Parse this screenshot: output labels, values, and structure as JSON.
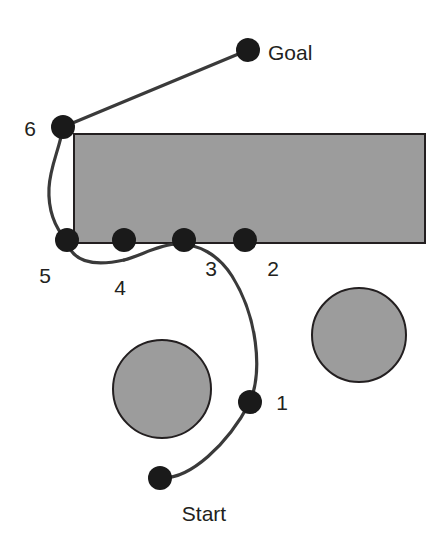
{
  "figure": {
    "type": "path-planning-diagram",
    "background_color": "#ffffff",
    "stroke_color": "#231f20",
    "obstacle_fill": "#9c9c9c",
    "obstacle_stroke": "#231f20",
    "waypoint_fill": "#1a1a1a",
    "path_color": "#3a3a3a"
  },
  "labels": {
    "start": "Start",
    "goal": "Goal",
    "w1": "1",
    "w2": "2",
    "w3": "3",
    "w4": "4",
    "w5": "5",
    "w6": "6"
  },
  "waypoints": [
    {
      "id": "start",
      "label": "Start",
      "cx": 160,
      "cy": 478,
      "r": 12,
      "label_x": 204,
      "label_y": 521
    },
    {
      "id": "w1",
      "label": "1",
      "cx": 250,
      "cy": 402,
      "r": 12,
      "label_x": 282,
      "label_y": 410
    },
    {
      "id": "w2",
      "label": "2",
      "cx": 245,
      "cy": 240,
      "r": 12,
      "label_x": 273,
      "label_y": 276
    },
    {
      "id": "w3",
      "label": "3",
      "cx": 184,
      "cy": 240,
      "r": 12,
      "label_x": 211,
      "label_y": 276
    },
    {
      "id": "w4",
      "label": "4",
      "cx": 124,
      "cy": 240,
      "r": 12,
      "label_x": 120,
      "label_y": 295
    },
    {
      "id": "w5",
      "label": "5",
      "cx": 67,
      "cy": 240,
      "r": 12,
      "label_x": 45,
      "label_y": 283
    },
    {
      "id": "w6",
      "label": "6",
      "cx": 63,
      "cy": 127,
      "r": 12,
      "label_x": 30,
      "label_y": 136
    },
    {
      "id": "goal",
      "label": "Goal",
      "cx": 248,
      "cy": 50,
      "r": 12,
      "label_x": 268,
      "label_y": 60
    }
  ],
  "obstacles": [
    {
      "id": "rectangle-obstacle",
      "shape": "rect",
      "x": 74,
      "y": 134,
      "width": 351,
      "height": 109
    },
    {
      "id": "circle-obstacle-left",
      "shape": "circle",
      "cx": 162,
      "cy": 389,
      "r": 49
    },
    {
      "id": "circle-obstacle-right",
      "shape": "circle",
      "cx": 359,
      "cy": 335,
      "r": 47
    }
  ],
  "path": {
    "id": "planned-path",
    "description": "Smooth curve from Start through waypoints 1-6 to Goal",
    "segments": [
      {
        "from": "start",
        "to": "w1",
        "d": "M 160 478 C 190 480 228 444 250 402"
      },
      {
        "from": "w1",
        "to": "w3",
        "d": "M 250 402 C 263 370 257 316 232 276 C 218 254 198 244 178 244"
      },
      {
        "from": "w3",
        "to": "w4",
        "d": "M 178 244 C 160 244 140 256 124 260"
      },
      {
        "from": "w4",
        "to": "w5",
        "d": "M 124 260 C 106 264 86 266 74 254 C 69 249 67 244 67 240"
      },
      {
        "from": "w5",
        "to": "w6",
        "d": "M 67 240 C 54 228 48 208 49 188 C 50 166 60 148 63 127"
      },
      {
        "from": "w6",
        "to": "goal",
        "d": "M 63 127 L 248 50"
      }
    ]
  }
}
